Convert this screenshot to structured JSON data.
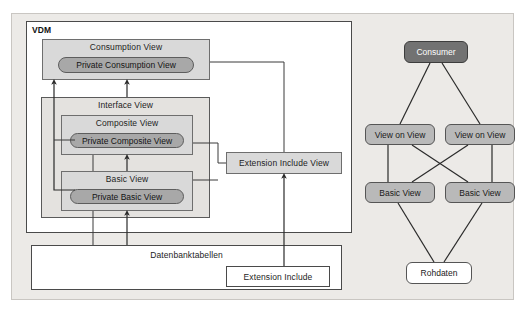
{
  "diagram": {
    "title_hidden": "",
    "left": {
      "vdm_label": "VDM",
      "consumption_view": "Consumption View",
      "private_consumption_view": "Private Consumption View",
      "interface_view": "Interface View",
      "composite_view": "Composite View",
      "private_composite_view": "Private Composite View",
      "basic_view": "Basic View",
      "private_basic_view": "Private Basic View",
      "extension_include_view": "Extension Include View",
      "datenbanktabellen": "Datenbanktabellen",
      "extension_include": "Extension Include"
    },
    "right": {
      "consumer": "Consumer",
      "view_on_view_left": "View on View",
      "view_on_view_right": "View on View",
      "basic_view_left": "Basic View",
      "basic_view_right": "Basic View",
      "rohdaten": "Rohdaten"
    },
    "colors": {
      "frame_bg": "#eceae7",
      "frame_border": "#c9c6c2",
      "grey_mid": "#bfbfbf",
      "grey_light": "#d9d9d9",
      "grey_pale": "#e4e2df",
      "pill_fill": "#a8a8a8",
      "node_dark": "#727272",
      "node_mid": "#b9b9b9",
      "node_white": "#ffffff",
      "line": "#3b3b3b",
      "text": "#1d1d1d"
    }
  }
}
